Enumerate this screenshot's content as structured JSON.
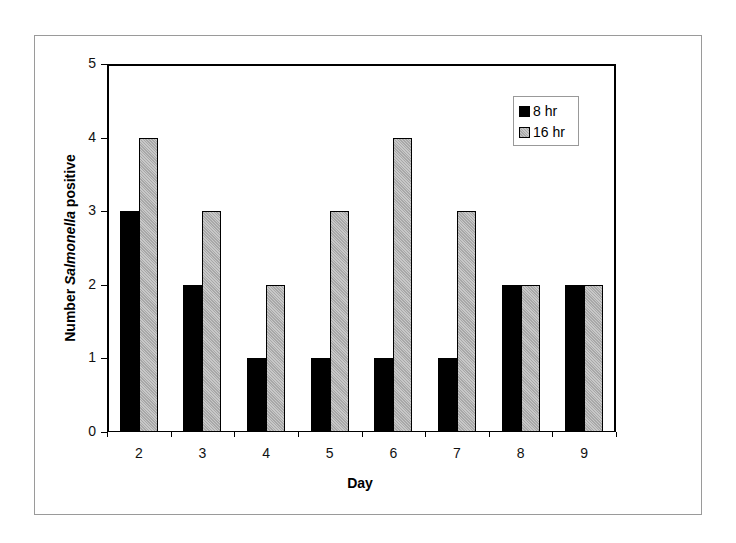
{
  "chart_data": {
    "type": "bar",
    "title": "",
    "xlabel": "Day",
    "ylabel_prefix": "Number ",
    "ylabel_italic": "Salmonella",
    "ylabel_suffix": " positive",
    "ylabel": "Number Salmonella positive",
    "categories": [
      "2",
      "3",
      "4",
      "5",
      "6",
      "7",
      "8",
      "9"
    ],
    "series": [
      {
        "name": "8 hr",
        "color": "#000000",
        "values": [
          3,
          2,
          1,
          1,
          1,
          1,
          2,
          2
        ]
      },
      {
        "name": "16 hr",
        "color": "#b8b8b8",
        "values": [
          4,
          3,
          2,
          3,
          4,
          3,
          2,
          2
        ]
      }
    ],
    "ylim": [
      0,
      5
    ],
    "yticks": [
      "0",
      "1",
      "2",
      "3",
      "4",
      "5"
    ],
    "grid": false,
    "legend_position": "upper right inside"
  }
}
